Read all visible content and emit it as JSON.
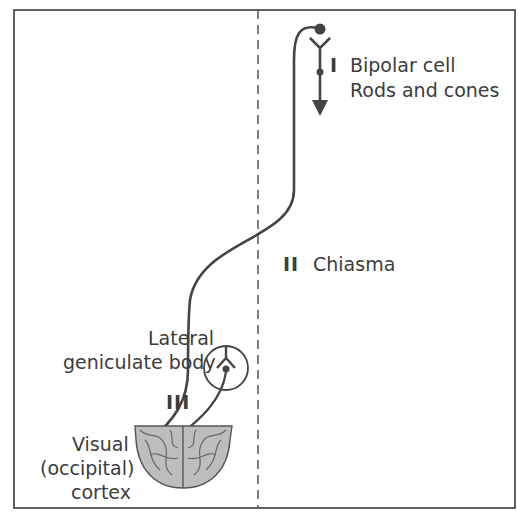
{
  "figure": {
    "frame_color": "#3a3a3a",
    "line_color": "#444444",
    "cortex_fill": "#b8b8b8",
    "cortex_stroke": "#555555",
    "midline": "dashed"
  },
  "labels": {
    "stage_1_numeral": "I",
    "stage_1_line1": "Bipolar cell",
    "stage_1_line2": "Rods and cones",
    "stage_2_numeral": "II",
    "stage_2_text": "Chiasma",
    "lgb_line1": "Lateral",
    "lgb_line2": "geniculate body",
    "stage_3_numeral": "III",
    "cortex_line1": "Visual",
    "cortex_line2": "(occipital)",
    "cortex_line3": "cortex"
  }
}
